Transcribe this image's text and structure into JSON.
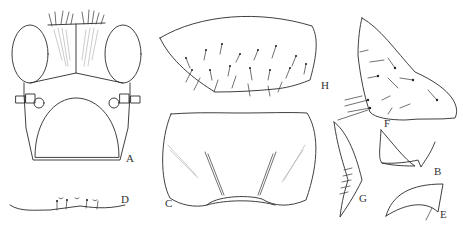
{
  "figure": {
    "panels": [
      {
        "id": "A",
        "label": "A",
        "description": "head, frontal view"
      },
      {
        "id": "B",
        "label": "B",
        "description": "mandible"
      },
      {
        "id": "C",
        "label": "C",
        "description": "plate with striated areas"
      },
      {
        "id": "D",
        "label": "D",
        "description": "margin with setae"
      },
      {
        "id": "E",
        "label": "E",
        "description": "claw"
      },
      {
        "id": "F",
        "label": "F",
        "description": "setose lobe"
      },
      {
        "id": "G",
        "label": "G",
        "description": "blade with spines"
      },
      {
        "id": "H",
        "label": "H",
        "description": "setose plate"
      }
    ],
    "colors": {
      "line": "#2a2a2a",
      "background": "#ffffff",
      "shading": "#aaaaaa"
    }
  }
}
